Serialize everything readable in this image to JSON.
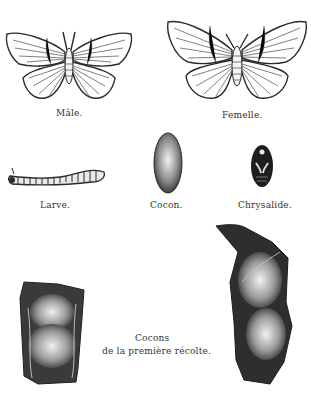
{
  "plate": {
    "figures": [
      {
        "id": "male",
        "caption": "Mâle."
      },
      {
        "id": "female",
        "caption": "Femelle."
      },
      {
        "id": "larva",
        "caption": "Larve."
      },
      {
        "id": "cocoon",
        "caption": "Cocon."
      },
      {
        "id": "chrysalis",
        "caption": "Chrysalide."
      },
      {
        "id": "first-harvest-cocoons",
        "caption_line1": "Cocons",
        "caption_line2": "de la première récolte."
      }
    ]
  },
  "colors": {
    "ink": "#2a2a2a",
    "paper": "#ffffff"
  }
}
